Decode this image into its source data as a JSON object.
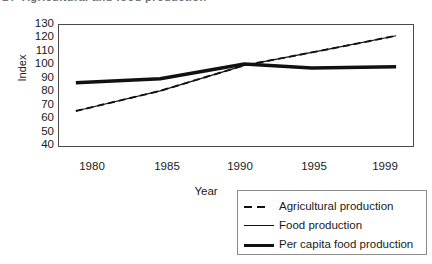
{
  "page": {
    "figure_number": "14",
    "title": "Agricultural and food production",
    "background": "#ffffff",
    "line_color": "#111111",
    "frame_color": "#4a4a4a"
  },
  "chart_data": {
    "type": "line",
    "title": "Agricultural and food production",
    "xlabel": "Year",
    "ylabel": "Index",
    "grid": false,
    "legend_position": "below-right",
    "xlim": [
      1979,
      2000
    ],
    "ylim": [
      40,
      130
    ],
    "ytick_labels": [
      "130",
      "120",
      "110",
      "100",
      "90",
      "80",
      "70",
      "60",
      "50",
      "40"
    ],
    "yticks": [
      130,
      120,
      110,
      100,
      90,
      80,
      70,
      60,
      50,
      40
    ],
    "xtick_labels": [
      "1980",
      "1985",
      "1990",
      "1995",
      "1999"
    ],
    "xticks": [
      1980,
      1985,
      1990,
      1995,
      1999
    ],
    "series": [
      {
        "name": "Agricultural production",
        "style": "dashed",
        "width": 1.8,
        "x": [
          1980,
          1985,
          1990,
          1995,
          1999
        ],
        "values": [
          66,
          81,
          100,
          112,
          122
        ]
      },
      {
        "name": "Food production",
        "style": "solid-thin",
        "width": 1.2,
        "x": [
          1980,
          1985,
          1990,
          1995,
          1999
        ],
        "values": [
          66,
          81,
          100,
          112,
          122
        ]
      },
      {
        "name": "Per capita food production",
        "style": "solid-thick",
        "width": 3.4,
        "x": [
          1980,
          1985,
          1990,
          1994,
          1999
        ],
        "values": [
          87,
          90,
          101,
          98,
          99
        ]
      }
    ]
  },
  "legend": {
    "items": [
      {
        "label": "Agricultural production",
        "style": "dashed"
      },
      {
        "label": "Food production",
        "style": "solid-thin"
      },
      {
        "label": "Per capita food production",
        "style": "solid-thick"
      }
    ]
  }
}
